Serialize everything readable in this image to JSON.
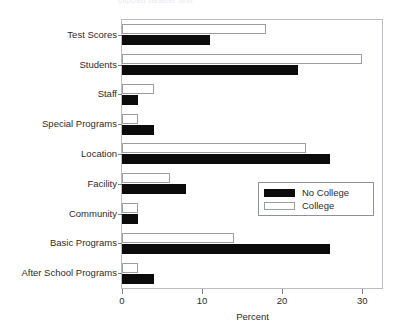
{
  "chart_data": {
    "type": "bar",
    "orientation": "horizontal",
    "title": "",
    "xlabel": "Percent",
    "ylabel": "",
    "xlim": [
      0,
      32.6
    ],
    "xticks": [
      0,
      10,
      20,
      30
    ],
    "xtick_labels": [
      "0",
      "10",
      "20",
      "30"
    ],
    "grid": false,
    "legend_position": "center-right",
    "categories": [
      "Test Scores",
      "Students",
      "Staff",
      "Special Programs",
      "Location",
      "Facility",
      "Community",
      "Basic Programs",
      "After School Programs"
    ],
    "series": [
      {
        "name": "No College",
        "color": "#0b0b0b",
        "values": [
          11,
          22,
          2,
          4,
          26,
          8,
          2,
          26,
          4
        ]
      },
      {
        "name": "College",
        "color": "#ffffff",
        "values": [
          18,
          30,
          4,
          2,
          23,
          6,
          2,
          14,
          2
        ]
      }
    ]
  },
  "legend": {
    "entries": [
      {
        "label": "No College",
        "swatch": "filled-black"
      },
      {
        "label": "College",
        "swatch": "outline-white"
      }
    ]
  },
  "axis": {
    "x_title": "Percent"
  },
  "title_remnant": "clipped header text"
}
